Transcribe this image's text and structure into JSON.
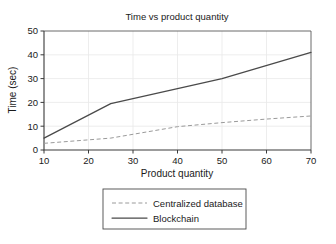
{
  "chart_data": {
    "type": "line",
    "title": "Time vs product quantity",
    "xlabel": "Product quantity",
    "ylabel": "Time (sec)",
    "xlim": [
      10,
      70
    ],
    "ylim": [
      0,
      50
    ],
    "xticks": [
      "10",
      "20",
      "30",
      "40",
      "50",
      "60",
      "70"
    ],
    "yticks": [
      "0",
      "10",
      "20",
      "30",
      "40",
      "50"
    ],
    "xtick_values": [
      10,
      20,
      30,
      40,
      50,
      60,
      70
    ],
    "ytick_values": [
      0,
      10,
      20,
      30,
      40,
      50
    ],
    "grid": true,
    "legend_position": "below",
    "series": [
      {
        "name": "Centralized database",
        "style": "dashed",
        "color": "#9a9a9a",
        "x": [
          10,
          25,
          40,
          50,
          60,
          70
        ],
        "values": [
          2.8,
          5.0,
          9.8,
          11.5,
          13.0,
          14.3
        ]
      },
      {
        "name": "Blockchain",
        "style": "solid",
        "color": "#4a4a4a",
        "x": [
          10,
          25,
          50,
          70
        ],
        "values": [
          5.0,
          19.5,
          30.0,
          41.0
        ]
      }
    ]
  },
  "legend": {
    "entries": [
      {
        "label": "Centralized database"
      },
      {
        "label": "Blockchain"
      }
    ]
  }
}
